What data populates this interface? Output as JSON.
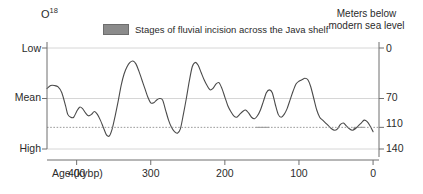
{
  "figure": {
    "left_axis_title": "O",
    "left_axis_title_sup": "18",
    "right_axis_title_line1": "Meters below",
    "right_axis_title_line2": "modern sea level",
    "x_axis_title": "Age (kybp)"
  },
  "legend": {
    "swatch_name": "shaded-incision-swatch",
    "label": "Stages of fluvial incision across the Java shelf",
    "swatch_color": "#8b8b8b"
  },
  "colors": {
    "curve": "#4a4a4a",
    "axis": "#6f6f6f",
    "gridline": "#d6d6d6",
    "dotted_line": "#9a9a9a",
    "shading": "#7a7a7a",
    "text": "#2b2b2b"
  },
  "chart_data": {
    "type": "line",
    "title": "",
    "subtitle": "",
    "xlabel": "Age (kybp)",
    "ylabel": "O18",
    "y2label": "Meters below modern sea level",
    "xlim": [
      440,
      -8
    ],
    "x_ticks": [
      400,
      300,
      200,
      100,
      0
    ],
    "x_tick_labels": [
      "400",
      "300",
      "200",
      "100",
      "0"
    ],
    "y_left_ticks": [
      "Low",
      "Mean",
      "High"
    ],
    "y_left_tick_values": [
      0,
      70,
      140
    ],
    "y_right_ticks": [
      0,
      70,
      110,
      140
    ],
    "y_right_tick_labels": [
      "0",
      "70",
      "110",
      "140"
    ],
    "ylim": [
      140,
      0
    ],
    "grid": true,
    "gridlines_at": [
      0,
      70,
      140
    ],
    "dotted_reference_line": 110,
    "legend_position": "top-center",
    "series": [
      {
        "name": "Relative sea level (O18 proxy)",
        "x": [
          440,
          435,
          430,
          425,
          420,
          415,
          412,
          408,
          404,
          400,
          396,
          392,
          388,
          384,
          380,
          376,
          372,
          368,
          364,
          360,
          356,
          352,
          348,
          344,
          340,
          336,
          332,
          328,
          324,
          320,
          316,
          312,
          308,
          304,
          300,
          296,
          292,
          288,
          284,
          280,
          276,
          272,
          268,
          264,
          260,
          256,
          252,
          248,
          244,
          240,
          236,
          232,
          228,
          224,
          220,
          216,
          212,
          208,
          204,
          200,
          196,
          192,
          188,
          184,
          180,
          176,
          172,
          168,
          164,
          160,
          156,
          152,
          148,
          144,
          140,
          136,
          132,
          128,
          124,
          120,
          116,
          112,
          108,
          104,
          100,
          96,
          92,
          88,
          84,
          80,
          76,
          72,
          68,
          64,
          60,
          56,
          52,
          48,
          44,
          40,
          36,
          32,
          28,
          24,
          20,
          16,
          12,
          8,
          4,
          0
        ],
        "y": [
          56,
          52,
          52,
          54,
          62,
          80,
          92,
          96,
          96,
          88,
          82,
          84,
          90,
          94,
          92,
          88,
          92,
          100,
          110,
          120,
          122,
          112,
          94,
          74,
          52,
          36,
          26,
          20,
          18,
          22,
          32,
          44,
          56,
          68,
          76,
          76,
          72,
          70,
          72,
          86,
          100,
          110,
          116,
          118,
          112,
          92,
          70,
          46,
          26,
          20,
          24,
          34,
          44,
          52,
          58,
          56,
          50,
          48,
          56,
          68,
          80,
          88,
          94,
          96,
          92,
          88,
          86,
          90,
          96,
          98,
          94,
          86,
          74,
          62,
          58,
          62,
          78,
          92,
          96,
          92,
          84,
          72,
          60,
          50,
          46,
          44,
          42,
          44,
          54,
          70,
          86,
          96,
          100,
          104,
          108,
          112,
          114,
          112,
          106,
          104,
          108,
          112,
          114,
          112,
          108,
          104,
          100,
          102,
          108,
          116
        ],
        "note": "Higher y = more meters below modern sea level (inverted axis)"
      }
    ],
    "shaded_regions": [
      {
        "name": "incision-stage-1",
        "x_start": 158,
        "x_end": 140,
        "below_level": 110,
        "label": "Stage of fluvial incision"
      },
      {
        "name": "incision-stage-2",
        "x_start": 26,
        "x_end": 12,
        "below_level": 110,
        "label": "Stage of fluvial incision (LGM)"
      }
    ],
    "annotations": []
  }
}
